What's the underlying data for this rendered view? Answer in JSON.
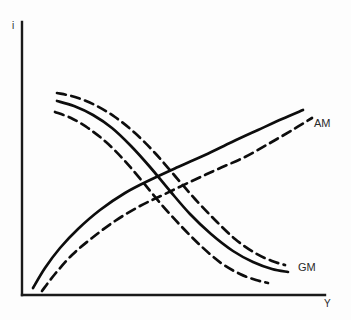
{
  "figure": {
    "background_color": "#fdfdfd",
    "line_color": "#0d0d0d",
    "axis_color": "#1a1a1a"
  },
  "axes": {
    "y_axis_label": "i",
    "x_axis_label": "Y",
    "origin_x": 22,
    "origin_y": 295,
    "y_axis_top": 22,
    "x_axis_right": 325
  },
  "labels": {
    "am": "AM",
    "gm": "GM"
  },
  "chart_data": {
    "type": "line",
    "title": "",
    "xlabel": "Y",
    "ylabel": "i",
    "grid": false,
    "legend_position": "inline-right",
    "xlim": [
      22,
      325
    ],
    "ylim": [
      295,
      22
    ],
    "note": "Schematic diagram: no numeric tick labels are shown on either axis. Coordinates are pixel positions in the source image; y increases downward.",
    "series": [
      {
        "name": "AM",
        "style": "solid",
        "direction": "upward-sloping",
        "points": [
          [
            33,
            288
          ],
          [
            45,
            268
          ],
          [
            60,
            248
          ],
          [
            78,
            229
          ],
          [
            100,
            210
          ],
          [
            125,
            193
          ],
          [
            150,
            180
          ],
          [
            178,
            167
          ],
          [
            205,
            155
          ],
          [
            232,
            142
          ],
          [
            258,
            130
          ],
          [
            282,
            119
          ],
          [
            303,
            110
          ]
        ]
      },
      {
        "name": "AM-shifted",
        "style": "dashed",
        "direction": "upward-sloping",
        "points": [
          [
            42,
            291
          ],
          [
            55,
            274
          ],
          [
            72,
            255
          ],
          [
            92,
            238
          ],
          [
            115,
            221
          ],
          [
            140,
            206
          ],
          [
            165,
            194
          ],
          [
            192,
            181
          ],
          [
            218,
            169
          ],
          [
            245,
            157
          ],
          [
            270,
            143
          ],
          [
            294,
            129
          ],
          [
            312,
            118
          ]
        ]
      },
      {
        "name": "GM-upper",
        "style": "dashed",
        "direction": "downward-sloping",
        "points": [
          [
            57,
            93
          ],
          [
            75,
            97
          ],
          [
            95,
            105
          ],
          [
            115,
            117
          ],
          [
            135,
            133
          ],
          [
            155,
            153
          ],
          [
            175,
            176
          ],
          [
            195,
            199
          ],
          [
            215,
            220
          ],
          [
            235,
            239
          ],
          [
            255,
            253
          ],
          [
            272,
            261
          ],
          [
            285,
            265
          ]
        ]
      },
      {
        "name": "GM",
        "style": "solid",
        "direction": "downward-sloping",
        "points": [
          [
            57,
            101
          ],
          [
            74,
            106
          ],
          [
            93,
            115
          ],
          [
            112,
            128
          ],
          [
            131,
            146
          ],
          [
            150,
            167
          ],
          [
            170,
            191
          ],
          [
            190,
            214
          ],
          [
            211,
            234
          ],
          [
            233,
            251
          ],
          [
            253,
            262
          ],
          [
            272,
            269
          ],
          [
            288,
            272
          ]
        ]
      },
      {
        "name": "GM-lower",
        "style": "dashed",
        "direction": "downward-sloping",
        "points": [
          [
            55,
            112
          ],
          [
            71,
            118
          ],
          [
            88,
            128
          ],
          [
            106,
            142
          ],
          [
            124,
            160
          ],
          [
            142,
            181
          ],
          [
            161,
            204
          ],
          [
            181,
            226
          ],
          [
            201,
            246
          ],
          [
            221,
            263
          ],
          [
            240,
            274
          ],
          [
            256,
            280
          ],
          [
            268,
            283
          ]
        ]
      }
    ]
  }
}
